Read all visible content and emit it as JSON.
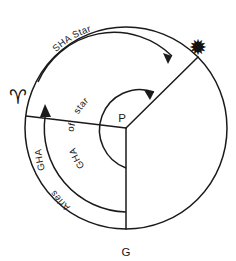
{
  "figure": {
    "background_color": "#ffffff",
    "line_color": "#1a1a1a"
  },
  "points": [
    {
      "id": "pole",
      "label": "P",
      "description": "Celestial pole at centre of diagram",
      "x": 126,
      "y": 128
    },
    {
      "id": "greenwich",
      "label": "G",
      "description": "Greenwich meridian on circle, bottom",
      "x": 126,
      "y": 243
    },
    {
      "id": "aries",
      "label": "♈",
      "icon": "aries-glyph",
      "description": "First Point of Aries on circle, left",
      "x": 20,
      "y": 97
    },
    {
      "id": "star",
      "label": "✹",
      "icon": "star-glyph",
      "description": "Star position on circle, upper right",
      "x": 208,
      "y": 46
    }
  ],
  "radii": [
    {
      "id": "radius-aries",
      "from": "pole",
      "to": "aries"
    },
    {
      "id": "radius-star",
      "from": "pole",
      "to": "star"
    },
    {
      "id": "radius-greenwich",
      "from": "pole",
      "to": "greenwich"
    }
  ],
  "arcs": [
    {
      "id": "sha-star",
      "label": "SHA Star",
      "from": "aries",
      "to": "star",
      "direction": "clockwise",
      "arrow": true,
      "ring": "outer"
    },
    {
      "id": "gha-star",
      "label": "GHA of star",
      "label_words": [
        "GHA",
        "of",
        "star"
      ],
      "from": "greenwich",
      "to": "star",
      "direction": "clockwise",
      "arrow": true,
      "ring": "inner"
    },
    {
      "id": "gha-aries",
      "label": "GHA Aries",
      "label_words": [
        "GHA",
        "Aries"
      ],
      "from": "greenwich",
      "to": "aries",
      "direction": "clockwise",
      "arrow": true,
      "ring": "middle"
    }
  ],
  "arc_label_text": {
    "sha_star": "SHA Star",
    "sha": "SHA",
    "star_word": "Star",
    "gha": "GHA",
    "of": "of",
    "star_lower": "star",
    "aries_word": "Aries"
  }
}
